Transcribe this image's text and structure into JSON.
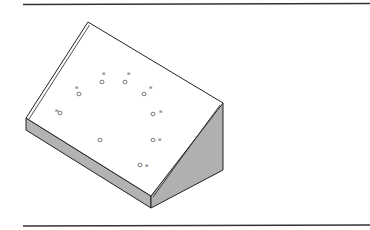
{
  "figure": {
    "type": "isometric-wedge-block",
    "top_face_fill": "#ffffff",
    "end_face_fill": "#b3b3b3",
    "side_face_fill": "#b0b0b0",
    "line_color": "#222222",
    "rule_color": "#333333"
  },
  "holes": [
    {
      "cx": 79,
      "cy": 94,
      "label": "⊞",
      "lx": 75,
      "ly": 89
    },
    {
      "cx": 102,
      "cy": 82,
      "label": "⊞",
      "lx": 102,
      "ly": 75
    },
    {
      "cx": 125,
      "cy": 82,
      "label": "⊞",
      "lx": 127,
      "ly": 75
    },
    {
      "cx": 144,
      "cy": 94,
      "label": "⊞",
      "lx": 149,
      "ly": 89
    },
    {
      "cx": 60,
      "cy": 113,
      "label": "⊞",
      "lx": 55,
      "ly": 112
    },
    {
      "cx": 153,
      "cy": 114,
      "label": "⊞",
      "lx": 159,
      "ly": 113
    },
    {
      "cx": 100,
      "cy": 140,
      "label": "",
      "lx": 0,
      "ly": 0
    },
    {
      "cx": 153,
      "cy": 140,
      "label": "⊞",
      "lx": 158,
      "ly": 141
    },
    {
      "cx": 140,
      "cy": 165,
      "label": "⊞",
      "lx": 145,
      "ly": 167
    }
  ]
}
